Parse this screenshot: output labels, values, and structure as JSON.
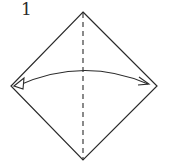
{
  "step": {
    "number": "1"
  },
  "diagram": {
    "shape": "square-diamond",
    "vertices": {
      "top": [
        83,
        12
      ],
      "left": [
        11,
        86
      ],
      "right": [
        157,
        86
      ],
      "bottom": [
        83,
        160
      ]
    },
    "fold_line": {
      "type": "valley-fold-dashed",
      "from": [
        83,
        12
      ],
      "to": [
        83,
        160
      ]
    },
    "arrow": {
      "type": "fold-and-unfold",
      "from": [
        148,
        84
      ],
      "to": [
        16,
        86
      ],
      "arc_peak_y": 70
    },
    "colors": {
      "stroke": "#2a2a2a",
      "background": "#ffffff"
    }
  }
}
